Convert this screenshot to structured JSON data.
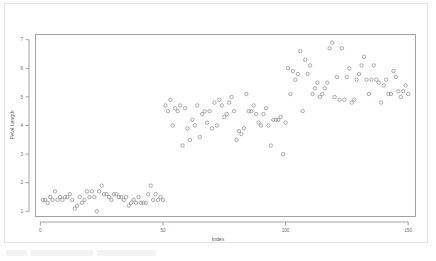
{
  "chart_data": {
    "type": "scatter",
    "title": "",
    "xlabel": "Index",
    "ylabel": "Petal.Length",
    "xlim": [
      -2,
      153
    ],
    "ylim": [
      0.82,
      7.18
    ],
    "xticks": [
      0,
      50,
      100,
      150
    ],
    "yticks": [
      1,
      2,
      3,
      4,
      5,
      6,
      7
    ],
    "grid": false,
    "legend": null,
    "marker": "open-circle",
    "marker_color": "#8e8e8e",
    "series": [
      {
        "name": "Petal.Length",
        "x": [
          1,
          2,
          3,
          4,
          5,
          6,
          7,
          8,
          9,
          10,
          11,
          12,
          13,
          14,
          15,
          16,
          17,
          18,
          19,
          20,
          21,
          22,
          23,
          24,
          25,
          26,
          27,
          28,
          29,
          30,
          31,
          32,
          33,
          34,
          35,
          36,
          37,
          38,
          39,
          40,
          41,
          42,
          43,
          44,
          45,
          46,
          47,
          48,
          49,
          50,
          51,
          52,
          53,
          54,
          55,
          56,
          57,
          58,
          59,
          60,
          61,
          62,
          63,
          64,
          65,
          66,
          67,
          68,
          69,
          70,
          71,
          72,
          73,
          74,
          75,
          76,
          77,
          78,
          79,
          80,
          81,
          82,
          83,
          84,
          85,
          86,
          87,
          88,
          89,
          90,
          91,
          92,
          93,
          94,
          95,
          96,
          97,
          98,
          99,
          100,
          101,
          102,
          103,
          104,
          105,
          106,
          107,
          108,
          109,
          110,
          111,
          112,
          113,
          114,
          115,
          116,
          117,
          118,
          119,
          120,
          121,
          122,
          123,
          124,
          125,
          126,
          127,
          128,
          129,
          130,
          131,
          132,
          133,
          134,
          135,
          136,
          137,
          138,
          139,
          140,
          141,
          142,
          143,
          144,
          145,
          146,
          147,
          148,
          149,
          150
        ],
        "values": [
          1.4,
          1.4,
          1.3,
          1.5,
          1.4,
          1.7,
          1.4,
          1.5,
          1.4,
          1.5,
          1.5,
          1.6,
          1.4,
          1.1,
          1.2,
          1.5,
          1.3,
          1.4,
          1.7,
          1.5,
          1.7,
          1.5,
          1.0,
          1.7,
          1.9,
          1.6,
          1.6,
          1.5,
          1.4,
          1.6,
          1.6,
          1.5,
          1.5,
          1.4,
          1.5,
          1.2,
          1.3,
          1.4,
          1.3,
          1.5,
          1.3,
          1.3,
          1.3,
          1.6,
          1.9,
          1.4,
          1.6,
          1.4,
          1.5,
          1.4,
          4.7,
          4.5,
          4.9,
          4.0,
          4.6,
          4.5,
          4.7,
          3.3,
          4.6,
          3.9,
          3.5,
          4.2,
          4.0,
          4.7,
          3.6,
          4.4,
          4.5,
          4.1,
          4.5,
          3.9,
          4.8,
          4.0,
          4.9,
          4.7,
          4.3,
          4.4,
          4.8,
          5.0,
          4.5,
          3.5,
          3.8,
          3.7,
          3.9,
          5.1,
          4.5,
          4.5,
          4.7,
          4.4,
          4.1,
          4.0,
          4.4,
          4.6,
          4.0,
          3.3,
          4.2,
          4.2,
          4.2,
          4.3,
          3.0,
          4.1,
          6.0,
          5.1,
          5.9,
          5.6,
          5.8,
          6.6,
          4.5,
          6.3,
          5.8,
          6.1,
          5.1,
          5.3,
          5.5,
          5.0,
          5.1,
          5.3,
          5.5,
          6.7,
          6.9,
          5.0,
          5.7,
          4.9,
          6.7,
          4.9,
          5.7,
          6.0,
          4.8,
          4.9,
          5.6,
          5.8,
          6.1,
          6.4,
          5.6,
          5.1,
          5.6,
          6.1,
          5.6,
          5.5,
          4.8,
          5.4,
          5.6,
          5.1,
          5.1,
          5.9,
          5.7,
          5.2,
          5.0,
          5.2,
          5.4,
          5.1
        ]
      }
    ]
  }
}
